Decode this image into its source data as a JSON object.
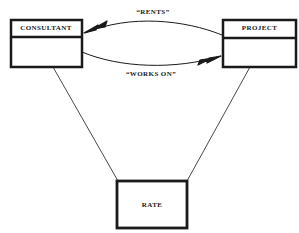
{
  "diagram": {
    "type": "entity-relationship",
    "entities": [
      {
        "id": "consultant",
        "label": "CONSULTANT",
        "has_attribute_section": true
      },
      {
        "id": "project",
        "label": "PROJECT",
        "has_attribute_section": true
      },
      {
        "id": "rate",
        "label": "RATE",
        "has_attribute_section": false
      }
    ],
    "relationships": [
      {
        "label": "“RENTS”",
        "from": "project",
        "to": "consultant",
        "arrow": "double-head"
      },
      {
        "label": "“WORKS ON”",
        "from": "consultant",
        "to": "project",
        "arrow": "double-head"
      }
    ],
    "links": [
      {
        "from": "consultant",
        "to": "rate"
      },
      {
        "from": "project",
        "to": "rate"
      }
    ],
    "colors": {
      "ink": "#1a1a1a",
      "background": "#ffffff"
    }
  }
}
